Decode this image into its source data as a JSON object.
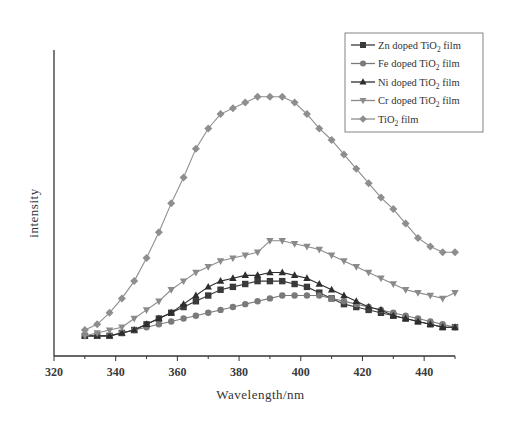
{
  "chart_data": {
    "type": "line",
    "title": "",
    "xlabel": "Wavelength/nm",
    "ylabel": "intensity",
    "xlim": [
      320,
      450
    ],
    "ylim": [
      0,
      100
    ],
    "xticks": [
      320,
      340,
      360,
      380,
      400,
      420,
      440
    ],
    "yticks": [],
    "grid": false,
    "legend_position": "upper right",
    "x": [
      330,
      334,
      338,
      342,
      346,
      350,
      354,
      358,
      362,
      366,
      370,
      374,
      378,
      382,
      386,
      390,
      394,
      398,
      402,
      406,
      410,
      414,
      418,
      422,
      426,
      430,
      434,
      438,
      442,
      446,
      450
    ],
    "series": [
      {
        "name": "Zn doped TiO2 film",
        "marker": "square",
        "color": "#3a3a3a",
        "values": [
          7,
          7,
          7,
          8,
          9,
          11,
          13,
          15,
          17,
          19,
          21,
          23,
          24,
          25,
          26,
          26,
          26,
          25,
          24,
          22,
          20,
          18,
          17,
          16,
          15,
          14,
          13,
          12,
          11,
          10,
          10
        ]
      },
      {
        "name": "Fe doped TiO2 film",
        "marker": "circle",
        "color": "#7a7a7a",
        "values": [
          7,
          7,
          7,
          8,
          9,
          10,
          11,
          12,
          13,
          14,
          15,
          16,
          17,
          18,
          19,
          20,
          21,
          21,
          21,
          21,
          20,
          19,
          18,
          17,
          16,
          15,
          14,
          13,
          12,
          11,
          10
        ]
      },
      {
        "name": "Ni doped TiO2 film",
        "marker": "triangle-up",
        "color": "#2e2e2e",
        "values": [
          7,
          7,
          7,
          8,
          9,
          11,
          13,
          15,
          18,
          21,
          24,
          26,
          27,
          28,
          28,
          29,
          29,
          28,
          27,
          25,
          23,
          21,
          19,
          17,
          16,
          14,
          13,
          12,
          11,
          10,
          10
        ]
      },
      {
        "name": "Cr doped TiO2 film",
        "marker": "triangle-down",
        "color": "#8a8a8a",
        "values": [
          7,
          8,
          9,
          10,
          13,
          16,
          19,
          23,
          26,
          29,
          31,
          33,
          34,
          35,
          36,
          40,
          40,
          39,
          38,
          37,
          35,
          33,
          31,
          29,
          27,
          25,
          23,
          22,
          21,
          20,
          22
        ]
      },
      {
        "name": "TiO2 film",
        "marker": "diamond",
        "color": "#8e8e8e",
        "values": [
          9,
          11,
          15,
          20,
          26,
          34,
          43,
          53,
          62,
          72,
          79,
          84,
          86,
          88,
          90,
          90,
          90,
          88,
          84,
          79,
          75,
          70,
          65,
          60,
          55,
          51,
          46,
          41,
          38,
          36,
          36
        ]
      }
    ]
  },
  "legend": {
    "items": [
      {
        "prefix": "Zn doped TiO",
        "sub": "2",
        "suffix": " film"
      },
      {
        "prefix": "Fe doped TiO",
        "sub": "2",
        "suffix": " film"
      },
      {
        "prefix": "Ni doped TiO",
        "sub": "2",
        "suffix": " film"
      },
      {
        "prefix": "Cr doped TiO",
        "sub": "2",
        "suffix": " film"
      },
      {
        "prefix": "TiO",
        "sub": "2",
        "suffix": " film"
      }
    ]
  }
}
